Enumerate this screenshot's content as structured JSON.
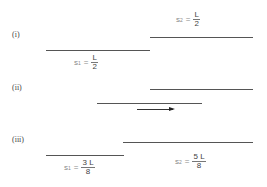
{
  "panels": [
    {
      "label": "(i)",
      "upper_line": {
        "x1": 150,
        "x2": 253,
        "y": 37
      },
      "lower_line": {
        "x1": 46,
        "x2": 150,
        "y": 50
      },
      "s1": {
        "var": "s",
        "sub": "1",
        "op": "=",
        "num": "L",
        "den": "2"
      },
      "s2": {
        "var": "s",
        "sub": "2",
        "op": "=",
        "num": "L",
        "den": "2"
      }
    },
    {
      "label": "(ii)",
      "upper_line": {
        "x1": 150,
        "x2": 253,
        "y": 89
      },
      "lower_line": {
        "x1": 97,
        "x2": 202,
        "y": 103
      },
      "arrow": {
        "x1": 137,
        "x2": 175,
        "y": 109,
        "direction": "right"
      }
    },
    {
      "label": "(iii)",
      "upper_line": {
        "x1": 123,
        "x2": 253,
        "y": 142
      },
      "lower_line": {
        "x1": 46,
        "x2": 124,
        "y": 155
      },
      "s1": {
        "var": "s",
        "sub": "1",
        "op": "=",
        "num": "3 L",
        "den": "8"
      },
      "s2": {
        "var": "s",
        "sub": "2",
        "op": "=",
        "num": "5 L",
        "den": "8"
      }
    }
  ]
}
